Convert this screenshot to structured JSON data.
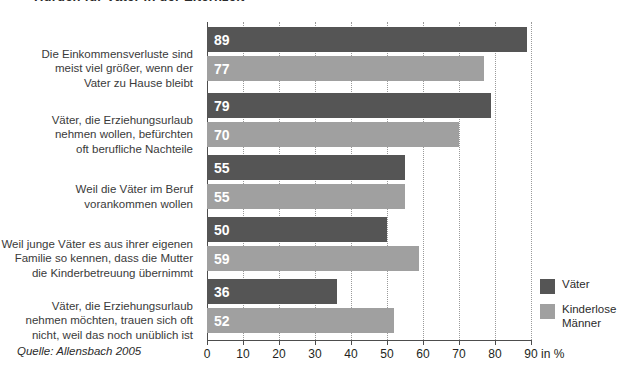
{
  "title": "Hürden für Väter in der Elternzeit",
  "source_note": "Quelle: Allensbach 2005",
  "axis_unit": "in %",
  "legend": {
    "items": [
      {
        "label": "Väter",
        "color": "#555555"
      },
      {
        "label": "Kinderlose\nMänner",
        "color": "#a0a0a0"
      }
    ]
  },
  "chart_data": {
    "type": "bar",
    "orientation": "horizontal",
    "title": "Hürden für Väter in der Elternzeit",
    "xlabel": "in %",
    "ylabel": "",
    "xlim": [
      0,
      90
    ],
    "xticks": [
      0,
      10,
      20,
      30,
      40,
      50,
      60,
      70,
      80,
      90
    ],
    "xtick_labels": [
      "0",
      "10",
      "20",
      "30",
      "40",
      "50",
      "60",
      "70",
      "80",
      "90"
    ],
    "grid": true,
    "legend_position": "right-bottom",
    "categories": [
      "Die Einkommensverluste sind meist viel größer, wenn der Vater zu Hause bleibt",
      "Väter, die Erziehungsurlaub nehmen wollen, befürchten oft berufliche Nachteile",
      "Weil die Väter im Beruf vorankommen wollen",
      "Weil junge Väter es aus ihrer eigenen Familie so kennen, dass die Mutter die Kinderbetreuung übernimmt",
      "Väter, die Erziehungsurlaub nehmen möchten, trauen sich oft nicht, weil das noch unüblich ist"
    ],
    "category_lines": [
      [
        "Die Einkommensverluste sind",
        "meist viel größer, wenn der",
        "Vater zu Hause bleibt"
      ],
      [
        "Väter, die Erziehungsurlaub",
        "nehmen wollen, befürchten",
        "oft berufliche Nachteile"
      ],
      [
        "Weil die Väter im Beruf",
        "vorankommen wollen"
      ],
      [
        "Weil junge Väter es aus ihrer eigenen",
        "Familie so kennen, dass die Mutter",
        "die Kinderbetreuung übernimmt"
      ],
      [
        "Väter, die Erziehungsurlaub",
        "nehmen möchten, trauen sich oft",
        "nicht, weil das noch unüblich ist"
      ]
    ],
    "series": [
      {
        "name": "Väter",
        "color": "#555555",
        "values": [
          89,
          79,
          55,
          50,
          36
        ]
      },
      {
        "name": "Kinderlose Männer",
        "color": "#a0a0a0",
        "values": [
          77,
          70,
          55,
          59,
          52
        ]
      }
    ]
  }
}
